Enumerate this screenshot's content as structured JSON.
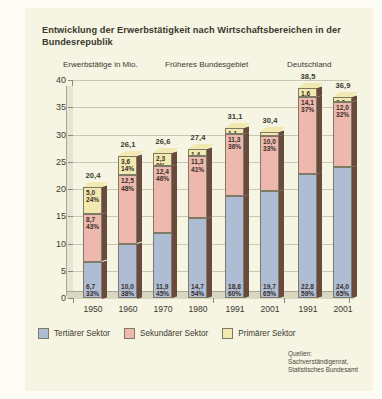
{
  "figure": {
    "title": "Entwicklung der Erwerbstätigkeit nach Wirtschaftsbereichen in der Bundesrepublik",
    "group_headers": [
      "Erwerbstätige in Mio.",
      "Früheres Bundesgebiet",
      "Deutschland"
    ],
    "source": {
      "line1": "Quellen:",
      "line2": "Sachverständigenrat,",
      "line3": "Statistisches Bundesamt"
    }
  },
  "chart_data": {
    "type": "bar",
    "title": "Entwicklung der Erwerbstätigkeit nach Wirtschaftsbereichen in der Bundesrepublik",
    "subtitle": "Erwerbstätige in Mio.",
    "xlabel": "",
    "ylabel": "Erwerbstätige in Mio.",
    "ylim": [
      0,
      40
    ],
    "yticks": [
      "0",
      "5",
      "10",
      "15",
      "20",
      "25",
      "30",
      "35",
      "40"
    ],
    "grid": true,
    "stacked": true,
    "legend_position": "bottom-left",
    "categories": [
      "1950",
      "1960",
      "1970",
      "1980",
      "1991",
      "2001",
      "1991",
      "2001"
    ],
    "group_of_category": [
      "Früheres Bundesgebiet",
      "Früheres Bundesgebiet",
      "Früheres Bundesgebiet",
      "Früheres Bundesgebiet",
      "Früheres Bundesgebiet",
      "Früheres Bundesgebiet",
      "Deutschland",
      "Deutschland"
    ],
    "totals": [
      "20,4",
      "26,1",
      "26,6",
      "27,4",
      "31,1",
      "30,4",
      "38,5",
      "36,9"
    ],
    "totals_numeric": [
      20.4,
      26.1,
      26.6,
      27.4,
      31.1,
      30.4,
      38.5,
      36.9
    ],
    "series": [
      {
        "name": "Tertiärer Sektor",
        "color": "#aebdd4",
        "values": [
          6.7,
          10.0,
          11.9,
          14.7,
          18.8,
          19.7,
          22.8,
          24.0
        ],
        "value_labels": [
          "6,7",
          "10,0",
          "11,9",
          "14,7",
          "18,8",
          "19,7",
          "22,8",
          "24,0"
        ],
        "percent_labels": [
          "33%",
          "38%",
          "45%",
          "54%",
          "60%",
          "65%",
          "59%",
          "65%"
        ]
      },
      {
        "name": "Sekundärer Sektor",
        "color": "#eeb8ae",
        "values": [
          8.7,
          12.5,
          12.4,
          11.3,
          11.3,
          10.0,
          14.1,
          12.0
        ],
        "value_labels": [
          "8,7",
          "12,5",
          "12,4",
          "11,3",
          "11,3",
          "10,0",
          "14,1",
          "12,0"
        ],
        "percent_labels": [
          "43%",
          "48%",
          "46%",
          "41%",
          "36%",
          "33%",
          "37%",
          "32%"
        ]
      },
      {
        "name": "Primärer Sektor",
        "color": "#f2e9b0",
        "values": [
          5.0,
          3.6,
          2.3,
          1.4,
          1.1,
          0.7,
          1.6,
          0.9
        ],
        "value_labels": [
          "5,0",
          "3,6",
          "2,3",
          "1,4",
          "1,1",
          "0,7",
          "1,6",
          "0,9"
        ],
        "percent_labels": [
          "24%",
          "14%",
          "9%",
          "5%",
          "3%",
          "2%",
          "4%",
          "3%"
        ]
      }
    ]
  },
  "legend": [
    {
      "label": "Tertiärer Sektor",
      "color": "#aebdd4"
    },
    {
      "label": "Sekundärer Sektor",
      "color": "#eeb8ae"
    },
    {
      "label": "Primärer Sektor",
      "color": "#f2e9b0"
    }
  ]
}
